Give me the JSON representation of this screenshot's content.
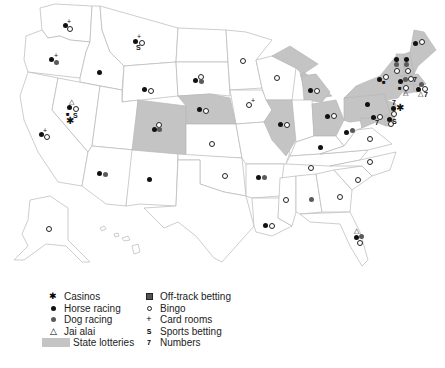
{
  "map": {
    "title": "",
    "lottery_color": "#c4c4c4",
    "border_color": "#b8b8b8",
    "lottery_states": [
      "Colorado",
      "Nebraska",
      "Illinois",
      "Michigan",
      "Ohio",
      "Pennsylvania",
      "New York",
      "Vermont",
      "New Hampshire",
      "Maine",
      "Massachusetts",
      "Connecticut",
      "Rhode Island",
      "New Jersey",
      "Delaware",
      "Maryland"
    ],
    "state_markers": [
      {
        "state": "Washington",
        "symbols": [
          "horse-racing",
          "card-rooms",
          "bingo"
        ]
      },
      {
        "state": "Oregon",
        "symbols": [
          "horse-racing",
          "card-rooms",
          "dog-racing"
        ]
      },
      {
        "state": "California",
        "symbols": [
          "horse-racing",
          "card-rooms",
          "bingo"
        ]
      },
      {
        "state": "Nevada",
        "symbols": [
          "jai-alai",
          "horse-racing",
          "bingo",
          "off-track-betting",
          "sports-betting",
          "casinos"
        ]
      },
      {
        "state": "Idaho",
        "symbols": [
          "horse-racing"
        ]
      },
      {
        "state": "Montana",
        "symbols": [
          "horse-racing",
          "card-rooms",
          "bingo",
          "sports-betting"
        ]
      },
      {
        "state": "Wyoming",
        "symbols": [
          "horse-racing",
          "bingo"
        ]
      },
      {
        "state": "Colorado",
        "symbols": [
          "bingo",
          "horse-racing",
          "dog-racing"
        ]
      },
      {
        "state": "Arizona",
        "symbols": [
          "horse-racing",
          "dog-racing"
        ]
      },
      {
        "state": "New Mexico",
        "symbols": [
          "horse-racing"
        ]
      },
      {
        "state": "South Dakota",
        "symbols": [
          "bingo",
          "horse-racing",
          "dog-racing"
        ]
      },
      {
        "state": "Nebraska",
        "symbols": [
          "horse-racing",
          "bingo"
        ]
      },
      {
        "state": "Kansas",
        "symbols": [
          "bingo"
        ]
      },
      {
        "state": "Oklahoma",
        "symbols": [
          "bingo"
        ]
      },
      {
        "state": "Minnesota",
        "symbols": [
          "bingo"
        ]
      },
      {
        "state": "Iowa",
        "symbols": [
          "bingo",
          "card-rooms"
        ]
      },
      {
        "state": "Arkansas",
        "symbols": [
          "horse-racing",
          "dog-racing"
        ]
      },
      {
        "state": "Louisiana",
        "symbols": [
          "horse-racing",
          "bingo"
        ]
      },
      {
        "state": "Wisconsin",
        "symbols": [
          "bingo"
        ]
      },
      {
        "state": "Illinois",
        "symbols": [
          "horse-racing",
          "bingo"
        ]
      },
      {
        "state": "Michigan",
        "symbols": [
          "horse-racing",
          "bingo"
        ]
      },
      {
        "state": "Ohio",
        "symbols": [
          "horse-racing",
          "bingo"
        ]
      },
      {
        "state": "Kentucky",
        "symbols": [
          "horse-racing"
        ]
      },
      {
        "state": "Tennessee",
        "symbols": [
          "bingo"
        ]
      },
      {
        "state": "Mississippi",
        "symbols": [
          "bingo"
        ]
      },
      {
        "state": "Alabama",
        "symbols": [
          "dog-racing"
        ]
      },
      {
        "state": "Georgia",
        "symbols": [
          "bingo"
        ]
      },
      {
        "state": "Florida",
        "symbols": [
          "jai-alai",
          "horse-racing",
          "dog-racing",
          "bingo"
        ]
      },
      {
        "state": "South Carolina",
        "symbols": [
          "bingo"
        ]
      },
      {
        "state": "North Carolina",
        "symbols": [
          "bingo"
        ]
      },
      {
        "state": "Virginia",
        "symbols": [
          "bingo"
        ]
      },
      {
        "state": "West Virginia",
        "symbols": [
          "horse-racing",
          "dog-racing"
        ]
      },
      {
        "state": "Pennsylvania",
        "symbols": [
          "horse-racing"
        ]
      },
      {
        "state": "Maryland",
        "symbols": [
          "horse-racing",
          "bingo",
          "numbers"
        ]
      },
      {
        "state": "Delaware",
        "symbols": [
          "horse-racing",
          "bingo",
          "sports-betting"
        ]
      },
      {
        "state": "New Jersey",
        "symbols": [
          "numbers",
          "horse-racing",
          "casinos",
          "bingo"
        ]
      },
      {
        "state": "New York",
        "symbols": [
          "horse-racing",
          "bingo",
          "off-track-betting"
        ]
      },
      {
        "state": "Vermont",
        "symbols": [
          "horse-racing",
          "dog-racing",
          "bingo"
        ]
      },
      {
        "state": "New Hampshire",
        "symbols": [
          "horse-racing",
          "dog-racing",
          "bingo"
        ]
      },
      {
        "state": "Maine",
        "symbols": [
          "horse-racing",
          "bingo"
        ]
      },
      {
        "state": "Massachusetts",
        "symbols": [
          "horse-racing",
          "dog-racing",
          "bingo",
          "numbers"
        ]
      },
      {
        "state": "Connecticut",
        "symbols": [
          "off-track-betting",
          "bingo",
          "jai-alai"
        ]
      },
      {
        "state": "Rhode Island",
        "symbols": [
          "horse-racing",
          "dog-racing",
          "bingo",
          "jai-alai",
          "numbers"
        ]
      },
      {
        "state": "Alaska",
        "symbols": [
          "bingo"
        ]
      }
    ]
  },
  "legend": {
    "left": [
      {
        "icon": "casinos-icon",
        "glyph": "✱",
        "label": "Casinos"
      },
      {
        "icon": "horse-racing-icon",
        "glyph": "●",
        "label": "Horse racing"
      },
      {
        "icon": "dog-racing-icon",
        "glyph": "●",
        "label": "Dog racing"
      },
      {
        "icon": "jai-alai-icon",
        "glyph": "△",
        "label": "Jai alai"
      },
      {
        "icon": "state-lotteries-swatch",
        "glyph": "",
        "label": "State lotteries"
      }
    ],
    "right": [
      {
        "icon": "off-track-betting-icon",
        "glyph": "■",
        "label": "Off-track betting"
      },
      {
        "icon": "bingo-icon",
        "glyph": "○",
        "label": "Bingo"
      },
      {
        "icon": "card-rooms-icon",
        "glyph": "+",
        "label": "Card rooms"
      },
      {
        "icon": "sports-betting-icon",
        "glyph": "S",
        "label": "Sports betting"
      },
      {
        "icon": "numbers-icon",
        "glyph": "7",
        "label": "Numbers"
      }
    ]
  }
}
